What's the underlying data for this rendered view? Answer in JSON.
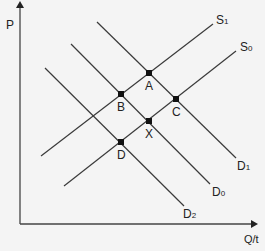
{
  "axes": {
    "y_label": "P",
    "x_label": "Q/t"
  },
  "curves": [
    {
      "id": "S1",
      "name": "S",
      "sub": "1",
      "type": "supply",
      "x1": 41,
      "y1": 156,
      "x2": 213,
      "y2": 24,
      "lx": 216,
      "ly": 14
    },
    {
      "id": "S0",
      "name": "S",
      "sub": "0",
      "type": "supply",
      "x1": 64,
      "y1": 186,
      "x2": 236,
      "y2": 51,
      "lx": 240,
      "ly": 41
    },
    {
      "id": "D1",
      "name": "D",
      "sub": "1",
      "type": "demand",
      "x1": 97,
      "y1": 22,
      "x2": 236,
      "y2": 158,
      "lx": 237,
      "ly": 160
    },
    {
      "id": "D0",
      "name": "D",
      "sub": "0",
      "type": "demand",
      "x1": 71,
      "y1": 44,
      "x2": 210,
      "y2": 184,
      "lx": 212,
      "ly": 186
    },
    {
      "id": "D2",
      "name": "D",
      "sub": "2",
      "type": "demand",
      "x1": 45,
      "y1": 68,
      "x2": 184,
      "y2": 206,
      "lx": 183,
      "ly": 208
    }
  ],
  "points": [
    {
      "label": "A",
      "x": 149,
      "y": 73,
      "lx": 145,
      "ly": 80
    },
    {
      "label": "B",
      "x": 121,
      "y": 94,
      "lx": 117,
      "ly": 101
    },
    {
      "label": "C",
      "x": 176,
      "y": 99,
      "lx": 172,
      "ly": 106
    },
    {
      "label": "X",
      "x": 149,
      "y": 121,
      "lx": 145,
      "ly": 128
    },
    {
      "label": "D",
      "x": 121,
      "y": 142,
      "lx": 117,
      "ly": 149
    }
  ],
  "colors": {
    "line": "#3a3a3a",
    "background": "#f4f4f4"
  }
}
